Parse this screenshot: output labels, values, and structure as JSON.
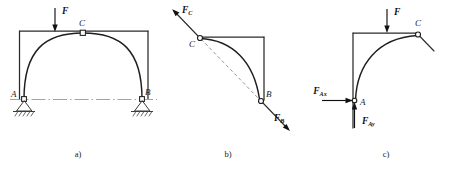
{
  "figure": {
    "panels": [
      {
        "id": "a",
        "caption": "a)",
        "description": "three-hinged arch with applied load F, pin supports at A and B, crown hinge at C",
        "labels": {
          "load": "F",
          "crown": "C",
          "support_left": "A",
          "support_right": "B"
        }
      },
      {
        "id": "b",
        "caption": "b)",
        "description": "free-body diagram of right half BC as a two-force member with forces along line CB",
        "labels": {
          "force_at_c": "F",
          "force_at_c_sub": "C",
          "force_at_b": "F",
          "force_at_b_sub": "B",
          "joint_c": "C",
          "joint_b": "B"
        }
      },
      {
        "id": "c",
        "caption": "c)",
        "description": "free-body diagram of left half AC with applied load F and reaction components at A",
        "labels": {
          "load": "F",
          "joint_c": "C",
          "joint_a": "A",
          "reaction_x": "F",
          "reaction_x_sub": "Ax",
          "reaction_y": "F",
          "reaction_y_sub": "Ay"
        }
      }
    ],
    "colors": {
      "line": "#2b2b2b",
      "arc": "#1f1f1f",
      "force": "#111111",
      "dashed": "#8a8a8a",
      "centerline": "#9a9a9a",
      "background": "#ffffff"
    }
  }
}
